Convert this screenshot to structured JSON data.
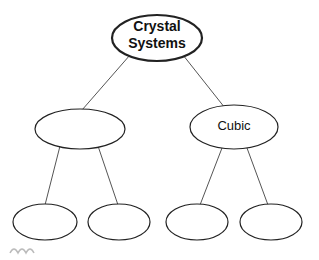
{
  "diagram": {
    "title": "Crystal Systems",
    "root": {
      "label_line1": "Crystal",
      "label_line2": "Systems"
    },
    "level1": [
      {
        "label": ""
      },
      {
        "label": "Cubic"
      }
    ],
    "level2": [
      {
        "label": ""
      },
      {
        "label": ""
      },
      {
        "label": ""
      },
      {
        "label": ""
      }
    ]
  }
}
